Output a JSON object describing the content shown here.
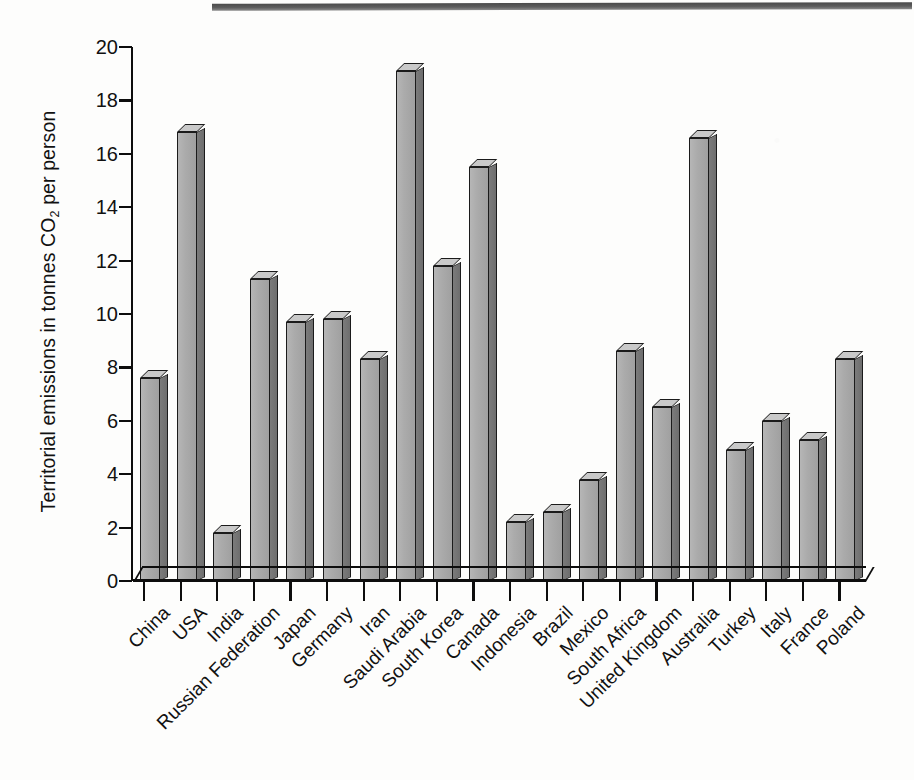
{
  "chart_data": {
    "type": "bar",
    "title": "",
    "xlabel": "",
    "ylabel": "Territorial emissions in tonnes CO2 per person",
    "ylabel_parts": {
      "before": "Territorial emissions in tonnes CO",
      "subscript": "2",
      "after": " per person"
    },
    "ylim": [
      0,
      20
    ],
    "ytick_step": 2,
    "yticks": [
      "20",
      "18",
      "16",
      "14",
      "12",
      "10",
      "8",
      "6",
      "4",
      "2",
      "0"
    ],
    "grid": false,
    "legend": "none",
    "bar_style": "3d-extruded-grayscale",
    "categories": [
      "China",
      "USA",
      "India",
      "Russian Federation",
      "Japan",
      "Germany",
      "Iran",
      "Saudi Arabia",
      "South Korea",
      "Canada",
      "Indonesia",
      "Brazil",
      "Mexico",
      "South Africa",
      "United Kingdom",
      "Australia",
      "Turkey",
      "Italy",
      "France",
      "Poland"
    ],
    "values": [
      7.6,
      16.8,
      1.8,
      11.3,
      9.7,
      9.8,
      8.3,
      19.1,
      11.8,
      15.5,
      2.2,
      2.6,
      3.8,
      8.6,
      6.5,
      16.6,
      4.9,
      6.0,
      5.3,
      8.3
    ]
  },
  "colors": {
    "bar_front": "#ababab",
    "bar_side": "#737373",
    "bar_top": "#c9c9c9",
    "outline": "#1b1b1b",
    "axis": "#0d0d0d",
    "background": "#fdfdfc"
  }
}
